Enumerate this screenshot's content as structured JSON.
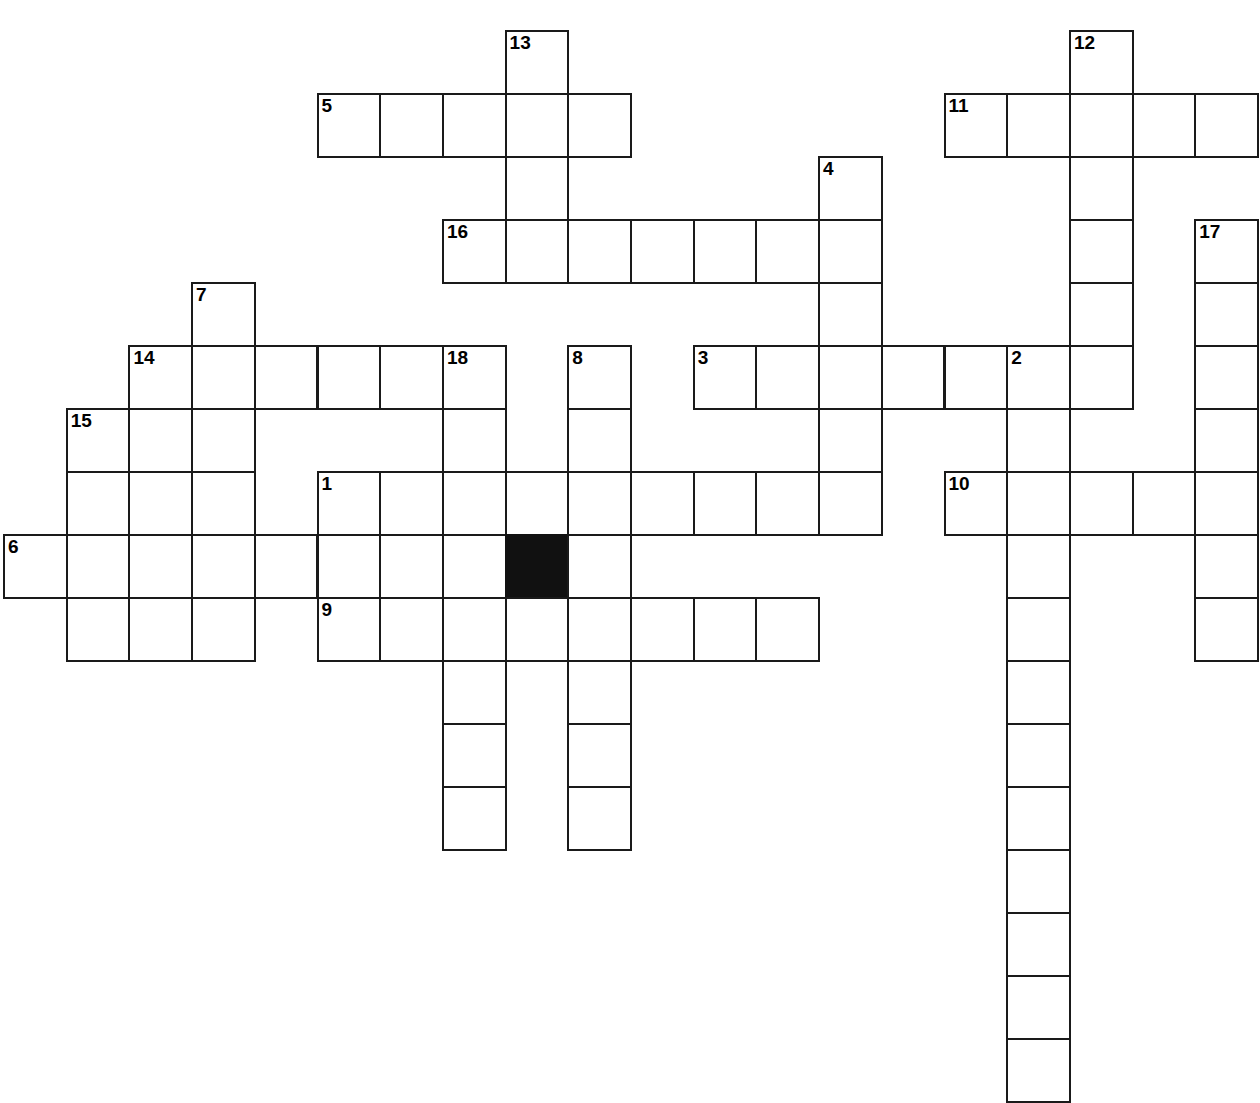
{
  "puzzle": {
    "title": "Crossword Puzzle Grid",
    "grid": {
      "cell_size": 62.7,
      "row_height": 63,
      "origin_x": 3,
      "origin_y": 30,
      "columns": 20,
      "rows": 17,
      "background_color": "#ffffff",
      "line_color": "#1a1a1a",
      "blocked_color": "#111111",
      "number_color": "#000000"
    },
    "entries": [
      {
        "number": "1",
        "direction": "across",
        "row": 7,
        "col": 5,
        "length": 9
      },
      {
        "number": "2",
        "direction": "down",
        "row": 5,
        "col": 16,
        "length": 11
      },
      {
        "number": "3",
        "direction": "across",
        "row": 5,
        "col": 11,
        "length": 7
      },
      {
        "number": "4",
        "direction": "down",
        "row": 2,
        "col": 13,
        "length": 6
      },
      {
        "number": "5",
        "direction": "across",
        "row": 1,
        "col": 5,
        "length": 5
      },
      {
        "number": "6",
        "direction": "across",
        "row": 8,
        "col": 0,
        "length": 6
      },
      {
        "number": "7",
        "direction": "down",
        "row": 4,
        "col": 3,
        "length": 6
      },
      {
        "number": "8",
        "direction": "down",
        "row": 5,
        "col": 9,
        "length": 9
      },
      {
        "number": "9",
        "direction": "across",
        "row": 9,
        "col": 5,
        "length": 8
      },
      {
        "number": "10",
        "direction": "across",
        "row": 7,
        "col": 15,
        "length": 5
      },
      {
        "number": "11",
        "direction": "across",
        "row": 1,
        "col": 15,
        "length": 5
      },
      {
        "number": "12",
        "direction": "down",
        "row": 0,
        "col": 17,
        "length": 6
      },
      {
        "number": "13",
        "direction": "down",
        "row": 0,
        "col": 8,
        "length": 4
      },
      {
        "number": "14",
        "direction": "across",
        "row": 5,
        "col": 2,
        "length": 6
      },
      {
        "number": "15",
        "direction": "down",
        "row": 6,
        "col": 1,
        "length": 4
      },
      {
        "number": "16",
        "direction": "across",
        "row": 3,
        "col": 7,
        "length": 7
      },
      {
        "number": "17",
        "direction": "down",
        "row": 3,
        "col": 19,
        "length": 7
      },
      {
        "number": "18",
        "direction": "down",
        "row": 5,
        "col": 7,
        "length": 9
      }
    ],
    "cells": [
      {
        "row": 0,
        "col": 8,
        "number": "13"
      },
      {
        "row": 0,
        "col": 17,
        "number": "12"
      },
      {
        "row": 1,
        "col": 5,
        "number": "5"
      },
      {
        "row": 1,
        "col": 6
      },
      {
        "row": 1,
        "col": 7
      },
      {
        "row": 1,
        "col": 8
      },
      {
        "row": 1,
        "col": 9
      },
      {
        "row": 1,
        "col": 15,
        "number": "11"
      },
      {
        "row": 1,
        "col": 16
      },
      {
        "row": 1,
        "col": 17
      },
      {
        "row": 1,
        "col": 18
      },
      {
        "row": 1,
        "col": 19
      },
      {
        "row": 2,
        "col": 8
      },
      {
        "row": 2,
        "col": 13,
        "number": "4"
      },
      {
        "row": 2,
        "col": 17
      },
      {
        "row": 3,
        "col": 7,
        "number": "16"
      },
      {
        "row": 3,
        "col": 8
      },
      {
        "row": 3,
        "col": 9
      },
      {
        "row": 3,
        "col": 10
      },
      {
        "row": 3,
        "col": 11
      },
      {
        "row": 3,
        "col": 12
      },
      {
        "row": 3,
        "col": 13
      },
      {
        "row": 3,
        "col": 17
      },
      {
        "row": 3,
        "col": 19,
        "number": "17"
      },
      {
        "row": 4,
        "col": 3,
        "number": "7"
      },
      {
        "row": 4,
        "col": 13
      },
      {
        "row": 4,
        "col": 17
      },
      {
        "row": 4,
        "col": 19
      },
      {
        "row": 5,
        "col": 2,
        "number": "14"
      },
      {
        "row": 5,
        "col": 3
      },
      {
        "row": 5,
        "col": 4
      },
      {
        "row": 5,
        "col": 5
      },
      {
        "row": 5,
        "col": 6
      },
      {
        "row": 5,
        "col": 7,
        "number": "18"
      },
      {
        "row": 5,
        "col": 9,
        "number": "8"
      },
      {
        "row": 5,
        "col": 11,
        "number": "3"
      },
      {
        "row": 5,
        "col": 12
      },
      {
        "row": 5,
        "col": 13
      },
      {
        "row": 5,
        "col": 14
      },
      {
        "row": 5,
        "col": 15
      },
      {
        "row": 5,
        "col": 16,
        "number": "2"
      },
      {
        "row": 5,
        "col": 17
      },
      {
        "row": 5,
        "col": 19
      },
      {
        "row": 6,
        "col": 1,
        "number": "15"
      },
      {
        "row": 6,
        "col": 2
      },
      {
        "row": 6,
        "col": 3
      },
      {
        "row": 6,
        "col": 7
      },
      {
        "row": 6,
        "col": 9
      },
      {
        "row": 6,
        "col": 13
      },
      {
        "row": 6,
        "col": 16
      },
      {
        "row": 6,
        "col": 19
      },
      {
        "row": 7,
        "col": 1
      },
      {
        "row": 7,
        "col": 2
      },
      {
        "row": 7,
        "col": 3
      },
      {
        "row": 7,
        "col": 5,
        "number": "1"
      },
      {
        "row": 7,
        "col": 6
      },
      {
        "row": 7,
        "col": 7
      },
      {
        "row": 7,
        "col": 8
      },
      {
        "row": 7,
        "col": 9
      },
      {
        "row": 7,
        "col": 10
      },
      {
        "row": 7,
        "col": 11
      },
      {
        "row": 7,
        "col": 12
      },
      {
        "row": 7,
        "col": 13
      },
      {
        "row": 7,
        "col": 15,
        "number": "10"
      },
      {
        "row": 7,
        "col": 16
      },
      {
        "row": 7,
        "col": 17
      },
      {
        "row": 7,
        "col": 18
      },
      {
        "row": 7,
        "col": 19
      },
      {
        "row": 8,
        "col": 0,
        "number": "6"
      },
      {
        "row": 8,
        "col": 1
      },
      {
        "row": 8,
        "col": 2
      },
      {
        "row": 8,
        "col": 3
      },
      {
        "row": 8,
        "col": 4
      },
      {
        "row": 8,
        "col": 5
      },
      {
        "row": 8,
        "col": 6
      },
      {
        "row": 8,
        "col": 7
      },
      {
        "row": 8,
        "col": 8,
        "blocked": true
      },
      {
        "row": 8,
        "col": 9
      },
      {
        "row": 8,
        "col": 16
      },
      {
        "row": 8,
        "col": 19
      },
      {
        "row": 9,
        "col": 1
      },
      {
        "row": 9,
        "col": 2
      },
      {
        "row": 9,
        "col": 3
      },
      {
        "row": 9,
        "col": 5,
        "number": "9"
      },
      {
        "row": 9,
        "col": 6
      },
      {
        "row": 9,
        "col": 7
      },
      {
        "row": 9,
        "col": 8
      },
      {
        "row": 9,
        "col": 9
      },
      {
        "row": 9,
        "col": 10
      },
      {
        "row": 9,
        "col": 11
      },
      {
        "row": 9,
        "col": 12
      },
      {
        "row": 9,
        "col": 16
      },
      {
        "row": 9,
        "col": 19
      },
      {
        "row": 10,
        "col": 7
      },
      {
        "row": 10,
        "col": 9
      },
      {
        "row": 10,
        "col": 16
      },
      {
        "row": 11,
        "col": 7
      },
      {
        "row": 11,
        "col": 9
      },
      {
        "row": 11,
        "col": 16
      },
      {
        "row": 12,
        "col": 7
      },
      {
        "row": 12,
        "col": 9
      },
      {
        "row": 12,
        "col": 16
      },
      {
        "row": 13,
        "col": 16
      },
      {
        "row": 14,
        "col": 16
      },
      {
        "row": 15,
        "col": 16
      },
      {
        "row": 16,
        "col": 16
      }
    ]
  }
}
